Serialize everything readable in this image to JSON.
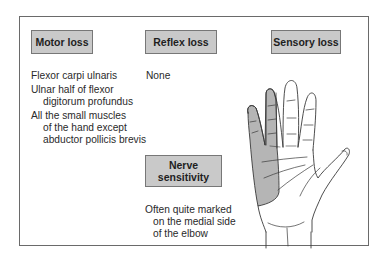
{
  "headers": {
    "motor": "Motor loss",
    "reflex": "Reflex loss",
    "sensory": "Sensory loss",
    "nerve_line1": "Nerve",
    "nerve_line2": "sensitivity"
  },
  "motor_loss": [
    {
      "line1": "Flexor carpi ulnaris"
    },
    {
      "line1": "Ulnar half of flexor",
      "line2": "digitorum profundus"
    },
    {
      "line1": "All the small muscles",
      "line2": "of the hand except",
      "line3": "abductor pollicis brevis"
    }
  ],
  "reflex_loss": "None",
  "nerve_sensitivity": {
    "line1": "Often quite marked",
    "line2": "on the medial side",
    "line3": "of the elbow"
  },
  "illustration": {
    "subject": "palm of hand with shaded ulnar sensory area (little finger and medial half of ring finger)",
    "shade_color": "#b5b5b5"
  }
}
